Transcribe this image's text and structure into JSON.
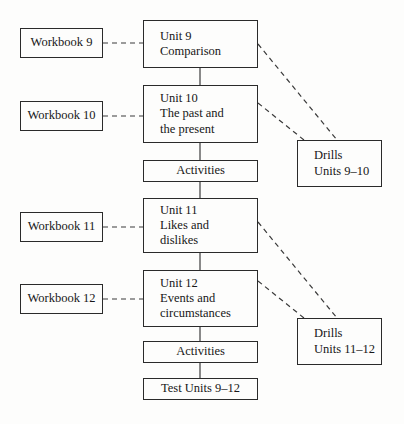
{
  "diagram": {
    "type": "flowchart",
    "colors": {
      "background": "#fdfdfc",
      "box_border": "#2a2a2a",
      "text": "#171717",
      "solid_connector": "#2a2a2a",
      "dashed_connector": "#3a3a3a"
    },
    "nodes": [
      {
        "id": "workbook-9",
        "kind": "workbook",
        "lines": [
          "Workbook 9"
        ],
        "x": 20,
        "y": 28,
        "w": 83,
        "h": 30
      },
      {
        "id": "unit-9",
        "kind": "unit",
        "lines": [
          "Unit 9",
          "Comparison"
        ],
        "x": 143,
        "y": 20,
        "w": 115,
        "h": 48
      },
      {
        "id": "workbook-10",
        "kind": "workbook",
        "lines": [
          "Workbook 10"
        ],
        "x": 20,
        "y": 101,
        "w": 83,
        "h": 30
      },
      {
        "id": "unit-10",
        "kind": "unit",
        "lines": [
          "Unit 10",
          "The past and",
          "the present"
        ],
        "x": 143,
        "y": 85,
        "w": 115,
        "h": 58
      },
      {
        "id": "activities-1",
        "kind": "activities",
        "lines": [
          "Activities"
        ],
        "x": 143,
        "y": 160,
        "w": 115,
        "h": 22
      },
      {
        "id": "drills-9-10",
        "kind": "drills",
        "lines": [
          "Drills",
          "Units 9–10"
        ],
        "x": 297,
        "y": 140,
        "w": 85,
        "h": 47
      },
      {
        "id": "workbook-11",
        "kind": "workbook",
        "lines": [
          "Workbook 11"
        ],
        "x": 20,
        "y": 212,
        "w": 83,
        "h": 30
      },
      {
        "id": "unit-11",
        "kind": "unit",
        "lines": [
          "Unit 11",
          "Likes and",
          "dislikes"
        ],
        "x": 143,
        "y": 198,
        "w": 115,
        "h": 55
      },
      {
        "id": "workbook-12",
        "kind": "workbook",
        "lines": [
          "Workbook 12"
        ],
        "x": 20,
        "y": 284,
        "w": 83,
        "h": 30
      },
      {
        "id": "unit-12",
        "kind": "unit",
        "lines": [
          "Unit 12",
          "Events and",
          "circumstances"
        ],
        "x": 143,
        "y": 270,
        "w": 115,
        "h": 57
      },
      {
        "id": "activities-2",
        "kind": "activities",
        "lines": [
          "Activities"
        ],
        "x": 143,
        "y": 341,
        "w": 115,
        "h": 22
      },
      {
        "id": "drills-11-12",
        "kind": "drills",
        "lines": [
          "Drills",
          "Units 11–12"
        ],
        "x": 297,
        "y": 318,
        "w": 85,
        "h": 47
      },
      {
        "id": "test-units",
        "kind": "test",
        "lines": [
          "Test Units 9–12"
        ],
        "x": 143,
        "y": 378,
        "w": 115,
        "h": 22
      }
    ],
    "edges": [
      {
        "id": "e-wb9-u9",
        "from": "workbook-9",
        "to": "unit-9",
        "style": "dashed",
        "x1": 103,
        "y1": 43,
        "x2": 143,
        "y2": 43
      },
      {
        "id": "e-u9-u10",
        "from": "unit-9",
        "to": "unit-10",
        "style": "solid",
        "x1": 200,
        "y1": 68,
        "x2": 200,
        "y2": 85
      },
      {
        "id": "e-wb10-u10",
        "from": "workbook-10",
        "to": "unit-10",
        "style": "dashed",
        "x1": 103,
        "y1": 116,
        "x2": 143,
        "y2": 116
      },
      {
        "id": "e-u10-act1",
        "from": "unit-10",
        "to": "activities-1",
        "style": "solid",
        "x1": 200,
        "y1": 143,
        "x2": 200,
        "y2": 160
      },
      {
        "id": "e-u9-drills1",
        "from": "unit-9",
        "to": "drills-9-10",
        "style": "dashed",
        "x1": 258,
        "y1": 44,
        "x2": 337,
        "y2": 140
      },
      {
        "id": "e-u10-drills1",
        "from": "unit-10",
        "to": "drills-9-10",
        "style": "dashed",
        "x1": 258,
        "y1": 103,
        "x2": 304,
        "y2": 140
      },
      {
        "id": "e-act1-u11",
        "from": "activities-1",
        "to": "unit-11",
        "style": "solid",
        "x1": 200,
        "y1": 182,
        "x2": 200,
        "y2": 198
      },
      {
        "id": "e-wb11-u11",
        "from": "workbook-11",
        "to": "unit-11",
        "style": "dashed",
        "x1": 103,
        "y1": 227,
        "x2": 143,
        "y2": 227
      },
      {
        "id": "e-u11-u12",
        "from": "unit-11",
        "to": "unit-12",
        "style": "solid",
        "x1": 200,
        "y1": 253,
        "x2": 200,
        "y2": 270
      },
      {
        "id": "e-wb12-u12",
        "from": "workbook-12",
        "to": "unit-12",
        "style": "dashed",
        "x1": 103,
        "y1": 299,
        "x2": 143,
        "y2": 299
      },
      {
        "id": "e-u11-drills2",
        "from": "unit-11",
        "to": "drills-11-12",
        "style": "dashed",
        "x1": 258,
        "y1": 222,
        "x2": 337,
        "y2": 318
      },
      {
        "id": "e-u12-drills2",
        "from": "unit-12",
        "to": "drills-11-12",
        "style": "dashed",
        "x1": 258,
        "y1": 281,
        "x2": 304,
        "y2": 318
      },
      {
        "id": "e-u12-act2",
        "from": "unit-12",
        "to": "activities-2",
        "style": "solid",
        "x1": 200,
        "y1": 327,
        "x2": 200,
        "y2": 341
      },
      {
        "id": "e-act2-test",
        "from": "activities-2",
        "to": "test-units",
        "style": "solid",
        "x1": 200,
        "y1": 363,
        "x2": 200,
        "y2": 378
      }
    ]
  }
}
